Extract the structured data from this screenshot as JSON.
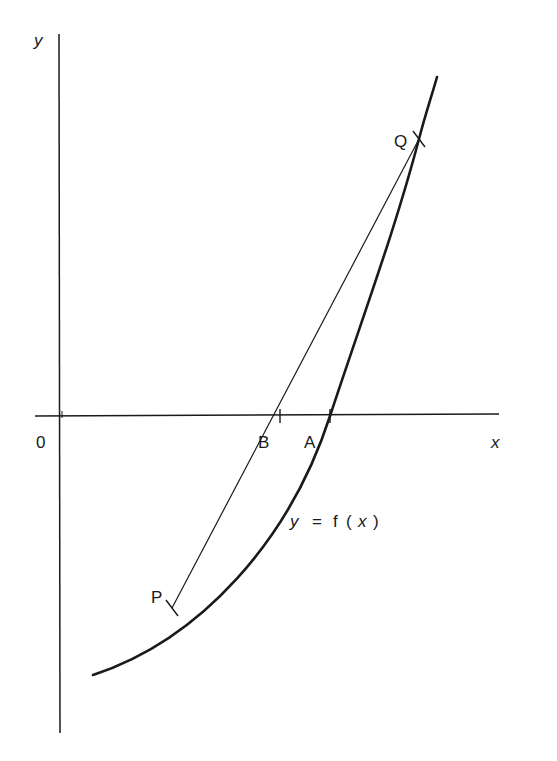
{
  "diagram": {
    "axes": {
      "x_label": "x",
      "y_label": "y",
      "origin_label": "0"
    },
    "curve": {
      "label": "y = f(x)",
      "label_parts": [
        "y",
        "=",
        "f",
        "(",
        "x",
        ")"
      ]
    },
    "points": {
      "P": "P",
      "Q": "Q",
      "A": "A",
      "B": "B"
    },
    "colors": {
      "ink": "#1a1a1a",
      "background": "#ffffff"
    }
  }
}
